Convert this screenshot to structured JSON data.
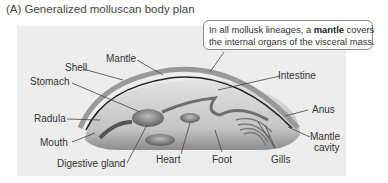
{
  "figure": {
    "title": "(A)  Generalized molluscan body plan",
    "callout": {
      "line1_pre": "In all mollusk lineages, a ",
      "line1_bold": "mantle",
      "line1_post": " covers",
      "line2": "the internal organs of the visceral mass."
    },
    "labels": {
      "mantle": "Mantle",
      "shell": "Shell",
      "stomach": "Stomach",
      "radula": "Radula",
      "mouth": "Mouth",
      "digestive_gland": "Digestive gland",
      "heart": "Heart",
      "foot": "Foot",
      "gills": "Gills",
      "intestine": "Intestine",
      "anus": "Anus",
      "mantle_cavity_1": "Mantle",
      "mantle_cavity_2": "cavity"
    },
    "colors": {
      "panel": "#ededed",
      "shell": "#9a9a9a",
      "mantle_line": "#222222",
      "body": "#c9c9c9",
      "organs": "#8a8a8a",
      "callout_border": "#888888"
    }
  }
}
